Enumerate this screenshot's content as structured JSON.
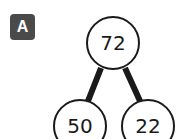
{
  "panel": {
    "label": "A"
  },
  "tree": {
    "nodes": [
      {
        "id": "root",
        "value": "72",
        "cx": 113,
        "cy": 43,
        "r": 27
      },
      {
        "id": "left",
        "value": "50",
        "cx": 80,
        "cy": 126,
        "r": 27
      },
      {
        "id": "right",
        "value": "22",
        "cx": 148,
        "cy": 126,
        "r": 27
      }
    ],
    "edges": [
      {
        "from": "root",
        "to": "left"
      },
      {
        "from": "root",
        "to": "right"
      }
    ],
    "colors": {
      "stroke": "#1a1a1a",
      "fill": "#ffffff",
      "badge": "#4a4a4a"
    }
  }
}
